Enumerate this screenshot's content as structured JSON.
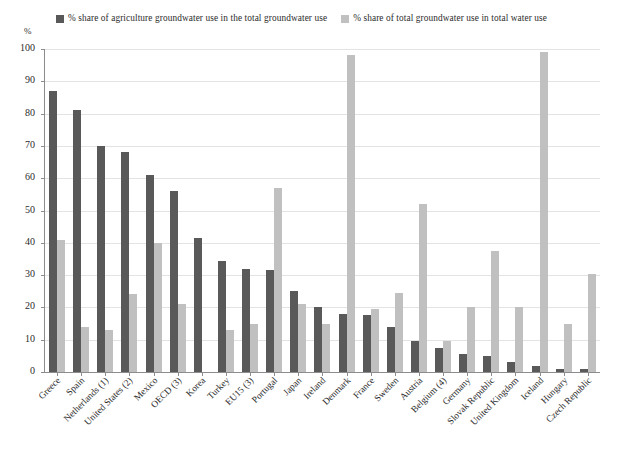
{
  "chart_data": {
    "type": "bar",
    "title": "",
    "xlabel": "",
    "ylabel": "%",
    "ylim": [
      0,
      100
    ],
    "yticks": [
      0,
      10,
      20,
      30,
      40,
      50,
      60,
      70,
      80,
      90,
      100
    ],
    "grid": true,
    "legend_position": "top",
    "colors": {
      "agriculture_groundwater": "#595959",
      "total_groundwater": "#c0c0c0"
    },
    "categories": [
      "Greece",
      "Spain",
      "Netherlands (1)",
      "United States (2)",
      "Mexico",
      "OECD (3)",
      "Korea",
      "Turkey",
      "EU15 (3)",
      "Portugal",
      "Japan",
      "Ireland",
      "Denmark",
      "France",
      "Sweden",
      "Austria",
      "Belgium (4)",
      "Germany",
      "Slovak Republic",
      "United Kingdom",
      "Iceland",
      "Hungary",
      "Czech Republic"
    ],
    "series": [
      {
        "name": "% share of agriculture groundwater use in the total groundwater use",
        "color": "#595959",
        "values": [
          87,
          81,
          70,
          68,
          61,
          56,
          41.5,
          34.5,
          32,
          31.5,
          25,
          20,
          18,
          17.5,
          14,
          9.5,
          7.5,
          5.5,
          5,
          3,
          2,
          1,
          1
        ]
      },
      {
        "name": "% share of total groundwater use in total water use",
        "color": "#c0c0c0",
        "values": [
          41,
          14,
          13,
          24,
          40,
          21,
          null,
          13,
          15,
          57,
          21,
          15,
          98,
          19.5,
          24.5,
          52,
          9.5,
          20,
          37.5,
          20,
          99,
          15,
          30.5
        ]
      }
    ]
  },
  "legend": {
    "items": [
      {
        "label": "% share of agriculture groundwater use in the total groundwater use",
        "color": "#595959"
      },
      {
        "label": "% share of total groundwater use in total water use",
        "color": "#c0c0c0"
      }
    ]
  },
  "axis": {
    "y_unit": "%"
  }
}
